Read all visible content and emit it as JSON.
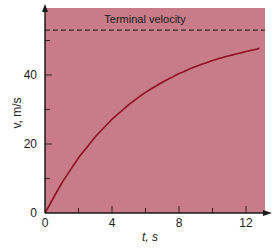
{
  "chart_data": {
    "type": "line",
    "title": "",
    "xlabel": "t, s",
    "ylabel": "v, m/s",
    "xlim": [
      0,
      12.8
    ],
    "ylim": [
      0,
      58
    ],
    "x_ticks": [
      0,
      4,
      8,
      12
    ],
    "x_ticks_labels": [
      "0",
      "4",
      "8",
      "12"
    ],
    "x_minor_ticks": [
      2,
      6,
      10
    ],
    "y_ticks": [
      0,
      20,
      40
    ],
    "y_ticks_labels": [
      "0",
      "20",
      "40"
    ],
    "y_minor_ticks": [
      10,
      30,
      50
    ],
    "grid": false,
    "legend": null,
    "series": [
      {
        "name": "velocity",
        "x": [
          0,
          1,
          2,
          3,
          4,
          5,
          6,
          7,
          8,
          9,
          10,
          11,
          12,
          12.8
        ],
        "values": [
          0,
          8.7,
          16.0,
          22.1,
          27.2,
          31.4,
          35.0,
          37.9,
          40.4,
          42.5,
          44.2,
          45.6,
          46.8,
          47.7
        ]
      }
    ],
    "annotations": [
      {
        "text": "Terminal velocity",
        "type": "hline",
        "y": 53,
        "style": "dashed"
      }
    ],
    "colors": {
      "plot_background": "#c77c88",
      "curve": "#8f1024",
      "axes": "#1a1a1a",
      "dashed_line": "#3a2a2c"
    }
  }
}
